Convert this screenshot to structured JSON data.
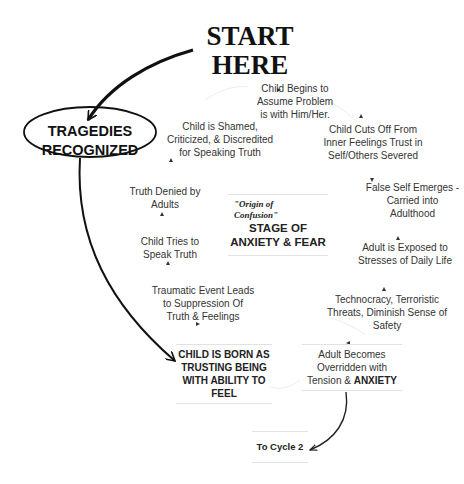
{
  "start": {
    "line1": "START",
    "line2": "HERE"
  },
  "tragedies": {
    "line1": "TRAGEDIES",
    "line2": "RECOGNIZED"
  },
  "center": {
    "origin_line1": "\"Origin of",
    "origin_line2": "Confusion\"",
    "stage_line1": "STAGE OF",
    "stage_line2": "ANXIETY & FEAR"
  },
  "cycle_nodes": [
    {
      "id": "child-begins",
      "lines": [
        "Child Begins to",
        "Assume Problem",
        "is with Him/Her."
      ]
    },
    {
      "id": "child-cuts-off",
      "lines": [
        "Child Cuts Off From",
        "Inner Feelings Trust in",
        "Self/Others Severed"
      ]
    },
    {
      "id": "false-self",
      "lines": [
        "False Self Emerges -",
        "Carried into",
        "Adulthood"
      ]
    },
    {
      "id": "adult-exposed",
      "lines": [
        "Adult is Exposed to",
        "Stresses of Daily Life"
      ]
    },
    {
      "id": "technocracy",
      "lines": [
        "Technocracy, Terroristic",
        "Threats, Diminish Sense of",
        "Safety"
      ]
    },
    {
      "id": "adult-becomes",
      "lines": [
        "Adult Becomes",
        "Overridden with",
        "Tension & "
      ],
      "emphasis": "ANXIETY"
    },
    {
      "id": "child-born",
      "lines": [
        "CHILD IS BORN AS",
        "TRUSTING  BEING",
        "WITH ABILITY TO",
        "FEEL"
      ]
    },
    {
      "id": "traumatic-event",
      "lines": [
        "Traumatic Event Leads",
        "to Suppression Of",
        "Truth & Feelings"
      ]
    },
    {
      "id": "child-tries",
      "lines": [
        "Child Tries to",
        "Speak Truth"
      ]
    },
    {
      "id": "truth-denied",
      "lines": [
        "Truth Denied by",
        "Adults"
      ]
    },
    {
      "id": "child-shamed",
      "lines": [
        "Child is Shamed,",
        "Criticized, & Discredited",
        "for Speaking Truth"
      ]
    }
  ],
  "to_cycle": {
    "label": "To Cycle 2"
  },
  "colors": {
    "ink": "#111111",
    "text": "#333333",
    "faint_line": "#e6e6e6",
    "background": "#ffffff"
  }
}
